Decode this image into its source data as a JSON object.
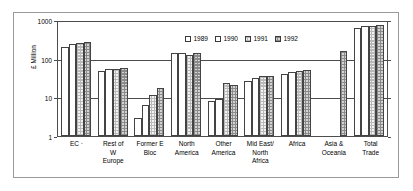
{
  "chart_data": {
    "type": "bar",
    "title": "",
    "xlabel": "",
    "ylabel": "£ Million",
    "yscale": "log",
    "ylim": [
      1,
      1000
    ],
    "ytick_labels": [
      "1000",
      "100",
      "10",
      "1"
    ],
    "ytick_values": [
      1000,
      100,
      10,
      1
    ],
    "grid": true,
    "legend_position": "top-center",
    "categories": [
      "EC ·",
      "Rest of\nW\nEurope",
      "Former E\nBloc",
      "North\nAmerica",
      "Other\nAmerica",
      "Mid East/\nNorth\nAfrica",
      "Africa",
      "Asia &\nOceania",
      "Total\nTrade"
    ],
    "series": [
      {
        "name": "1989",
        "swatch": "#ffffff",
        "values": [
          200,
          48,
          3.0,
          140,
          8.2,
          26,
          39,
          null,
          610
        ]
      },
      {
        "name": "1990",
        "swatch": "#ffffff",
        "values": [
          240,
          55,
          6.2,
          140,
          9.0,
          31,
          44,
          null,
          700
        ]
      },
      {
        "name": "1991",
        "swatch": "#f2f2f2",
        "values": [
          250,
          54,
          11.5,
          125,
          23,
          35,
          47,
          null,
          700
        ]
      },
      {
        "name": "1992",
        "swatch": "#d3d3d3",
        "values": [
          270,
          57,
          17,
          140,
          21,
          35,
          52,
          160,
          740
        ]
      }
    ]
  },
  "chart": {
    "y_axis_title": "£ Million",
    "y_ticks": [
      "1000",
      "100",
      "10",
      "1"
    ],
    "legend": [
      {
        "label": "1989"
      },
      {
        "label": "1990"
      },
      {
        "label": "1991"
      },
      {
        "label": "1992"
      }
    ],
    "x_categories": [
      {
        "lines": [
          "EC ·"
        ]
      },
      {
        "lines": [
          "Rest of",
          "W",
          "Europe"
        ]
      },
      {
        "lines": [
          "Former E",
          "Bloc"
        ]
      },
      {
        "lines": [
          "North",
          "America"
        ]
      },
      {
        "lines": [
          "Other",
          "America"
        ]
      },
      {
        "lines": [
          "Mid East/",
          "North",
          "Africa"
        ]
      },
      {
        "lines": [
          "Africa"
        ]
      },
      {
        "lines": [
          "Asia &",
          "Oceania"
        ]
      },
      {
        "lines": [
          "Total",
          "Trade"
        ]
      }
    ]
  }
}
